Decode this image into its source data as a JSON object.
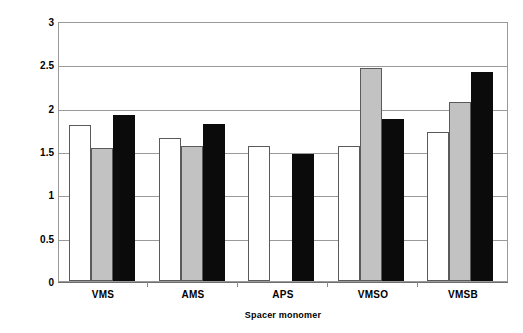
{
  "chart_data": {
    "type": "bar",
    "title": "",
    "xlabel": "Spacer monomer",
    "ylabel": "Mesh size (nm)",
    "categories": [
      "VMS",
      "AMS",
      "APS",
      "VMSO",
      "VMSB"
    ],
    "ylim": [
      0,
      3
    ],
    "ytick_labels": [
      "0",
      "0.5",
      "1",
      "1.5",
      "2",
      "2.5",
      "3"
    ],
    "ytick_values": [
      0,
      0.5,
      1,
      1.5,
      2,
      2.5,
      3
    ],
    "grid": true,
    "legend": "none",
    "series": [
      {
        "name": "series-1",
        "fill": "#ffffff",
        "values": [
          1.8,
          1.65,
          1.56,
          1.56,
          1.72
        ]
      },
      {
        "name": "series-2",
        "fill": "#c2c2c2",
        "values": [
          1.54,
          1.56,
          null,
          2.46,
          2.07
        ]
      },
      {
        "name": "series-3",
        "fill": "#0b0b0b",
        "values": [
          1.92,
          1.81,
          1.46,
          1.87,
          2.41
        ]
      }
    ]
  },
  "axis": {
    "y_title": "Mesh size (nm)",
    "x_title": "Spacer monomer"
  },
  "colors": {
    "series_white": "#ffffff",
    "series_gray": "#c2c2c2",
    "series_black": "#0b0b0b",
    "grid": "#9a9a9a",
    "axis": "#6e6e6e",
    "text": "#000000"
  }
}
